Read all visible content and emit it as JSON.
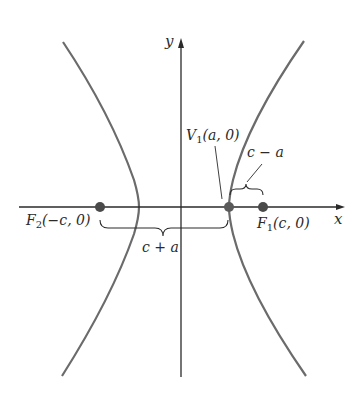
{
  "figure": {
    "type": "hyperbola",
    "equation_form": "x^2/a^2 - y^2/b^2 = 1",
    "colors": {
      "curve": "#6b6b6b",
      "axis": "#2a2a2a",
      "point": "#4a4a4a",
      "text": "#2a2a2a",
      "background": "#ffffff"
    }
  },
  "axes": {
    "x_label": "x",
    "y_label": "y"
  },
  "points": [
    {
      "id": "F2",
      "name": "F",
      "sub": "2",
      "coords": "(−c, 0)"
    },
    {
      "id": "V1",
      "name": "V",
      "sub": "1",
      "coords": "(a, 0)"
    },
    {
      "id": "F1",
      "name": "F",
      "sub": "1",
      "coords": "(c, 0)"
    }
  ],
  "distances": [
    {
      "id": "c_minus_a",
      "label": "c − a",
      "from": "V1",
      "to": "F1"
    },
    {
      "id": "c_plus_a",
      "label": "c + a",
      "from": "F2",
      "to": "V1"
    }
  ]
}
